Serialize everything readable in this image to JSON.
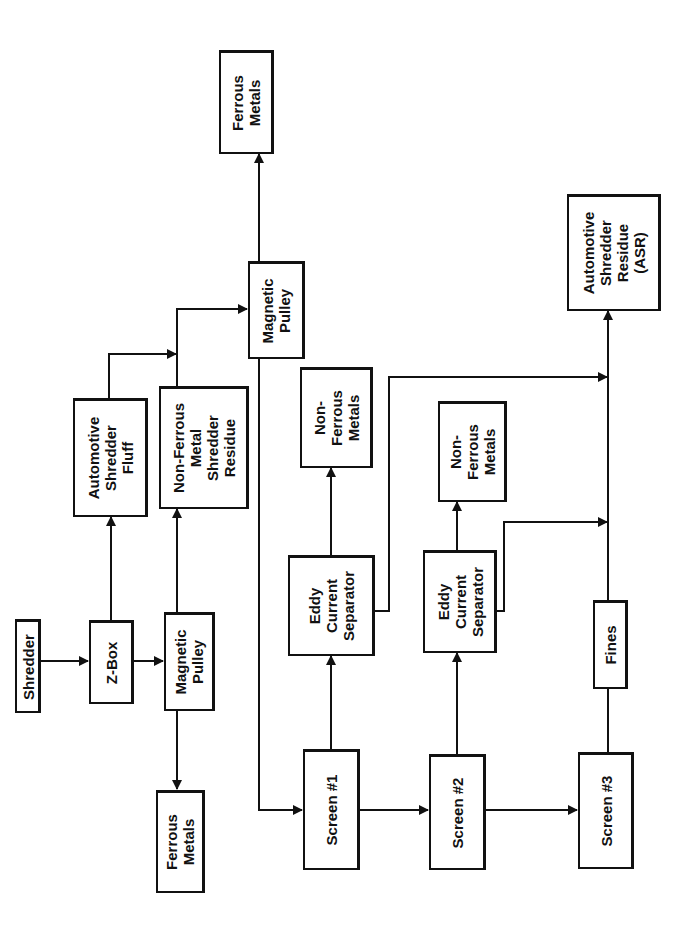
{
  "diagram": {
    "orientation": "rotated 90° counter-clockwise",
    "colors": {
      "stroke": "#111111",
      "background": "#ffffff"
    },
    "nodes": {
      "shredder": {
        "label": "Shredder"
      },
      "zbox": {
        "label": "Z-Box"
      },
      "magnetic_pulley_1": {
        "label": "Magnetic\nPulley"
      },
      "ferrous_metals_1": {
        "label": "Ferrous\nMetals"
      },
      "asf": {
        "label": "Automotive\nShredder\nFluff"
      },
      "nfmsr": {
        "label": "Non-Ferrous\nMetal\nShredder\nResidue"
      },
      "magnetic_pulley_2": {
        "label": "Magnetic\nPulley"
      },
      "ferrous_metals_2": {
        "label": "Ferrous\nMetals"
      },
      "screen_1": {
        "label": "Screen #1"
      },
      "screen_2": {
        "label": "Screen #2"
      },
      "screen_3": {
        "label": "Screen #3"
      },
      "ecs_1": {
        "label": "Eddy\nCurrent\nSeparator"
      },
      "ecs_2": {
        "label": "Eddy\nCurrent\nSeparator"
      },
      "nfm_1": {
        "label": "Non-\nFerrous\nMetals"
      },
      "nfm_2": {
        "label": "Non-\nFerrous\nMetals"
      },
      "fines": {
        "label": "Fines"
      },
      "asr": {
        "label": "Automotive\nShredder\nResidue\n(ASR)"
      }
    },
    "edges": [
      {
        "from": "Shredder",
        "to": "Z-Box"
      },
      {
        "from": "Z-Box",
        "to": "Automotive Shredder Fluff"
      },
      {
        "from": "Z-Box",
        "to": "Magnetic Pulley (1)"
      },
      {
        "from": "Magnetic Pulley (1)",
        "to": "Ferrous Metals (1)"
      },
      {
        "from": "Magnetic Pulley (1)",
        "to": "Non-Ferrous Metal Shredder Residue"
      },
      {
        "from": "Automotive Shredder Fluff",
        "to": "Magnetic Pulley (2)"
      },
      {
        "from": "Non-Ferrous Metal Shredder Residue",
        "to": "Magnetic Pulley (2)"
      },
      {
        "from": "Magnetic Pulley (2)",
        "to": "Ferrous Metals (2)"
      },
      {
        "from": "Magnetic Pulley (2)",
        "to": "Screen #1"
      },
      {
        "from": "Screen #1",
        "to": "Eddy Current Separator (1)"
      },
      {
        "from": "Screen #1",
        "to": "Screen #2"
      },
      {
        "from": "Eddy Current Separator (1)",
        "to": "Non-Ferrous Metals (1)"
      },
      {
        "from": "Eddy Current Separator (1)",
        "to": "Automotive Shredder Residue (ASR)"
      },
      {
        "from": "Screen #2",
        "to": "Eddy Current Separator (2)"
      },
      {
        "from": "Screen #2",
        "to": "Screen #3"
      },
      {
        "from": "Eddy Current Separator (2)",
        "to": "Non-Ferrous Metals (2)"
      },
      {
        "from": "Eddy Current Separator (2)",
        "to": "Automotive Shredder Residue (ASR)"
      },
      {
        "from": "Screen #3",
        "to": "Fines"
      },
      {
        "from": "Fines",
        "to": "Automotive Shredder Residue (ASR)"
      }
    ]
  }
}
